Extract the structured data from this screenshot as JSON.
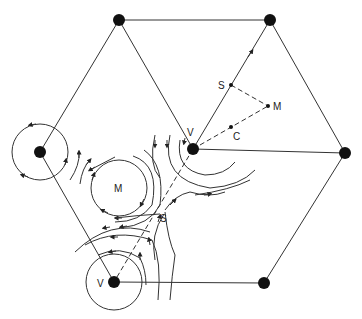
{
  "diagram": {
    "labels": {
      "v_center": "V",
      "v_bottom": "V",
      "m_circle": "M",
      "s_flow": "S",
      "s_edge": "S",
      "m_edge": "M",
      "c_edge": "C"
    },
    "nodes": [
      {
        "id": "top-left",
        "x": 119,
        "y": 20
      },
      {
        "id": "top-right",
        "x": 270,
        "y": 20
      },
      {
        "id": "left",
        "x": 40,
        "y": 152
      },
      {
        "id": "center-V",
        "x": 193,
        "y": 149
      },
      {
        "id": "right",
        "x": 345,
        "y": 153
      },
      {
        "id": "bottom-V",
        "x": 114,
        "y": 282
      },
      {
        "id": "bottom-right",
        "x": 264,
        "y": 283
      }
    ],
    "colors": {
      "line": "#333333",
      "node": "#111111",
      "background": "#ffffff"
    }
  }
}
